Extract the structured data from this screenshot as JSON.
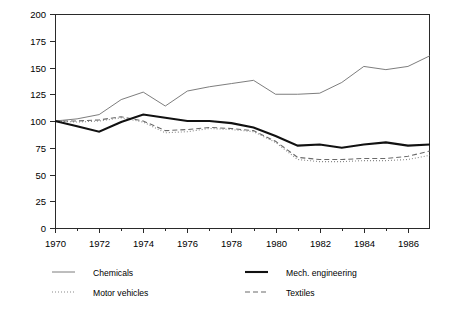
{
  "chart_data": {
    "type": "line",
    "title": "",
    "subtitle": "",
    "xlabel": "",
    "ylabel": "",
    "xlim": [
      1970,
      1987
    ],
    "ylim": [
      0,
      200
    ],
    "grid": false,
    "legend_position": "bottom",
    "x": [
      1970,
      1971,
      1972,
      1973,
      1974,
      1975,
      1976,
      1977,
      1978,
      1979,
      1980,
      1981,
      1982,
      1983,
      1984,
      1985,
      1986,
      1987
    ],
    "xticks": [
      "1970",
      "1972",
      "1974",
      "1976",
      "1978",
      "1980",
      "1982",
      "1984",
      "1986"
    ],
    "xtick_values": [
      1970,
      1972,
      1974,
      1976,
      1978,
      1980,
      1982,
      1984,
      1986
    ],
    "yticks": [
      "0",
      "25",
      "50",
      "75",
      "100",
      "125",
      "150",
      "175",
      "200"
    ],
    "ytick_values": [
      0,
      25,
      50,
      75,
      100,
      125,
      150,
      175,
      200
    ],
    "series": [
      {
        "name": "Chemicals",
        "style": "thin-solid",
        "color": "#6e6e6e",
        "values": [
          100,
          102,
          106,
          120,
          127,
          114,
          128,
          132,
          135,
          138,
          125,
          125,
          126,
          136,
          151,
          148,
          151,
          161
        ]
      },
      {
        "name": "Mech. engineering",
        "style": "thick-solid",
        "color": "#111111",
        "values": [
          100,
          95,
          90,
          99,
          106,
          103,
          100,
          100,
          98,
          94,
          86,
          77,
          78,
          75,
          78,
          80,
          77,
          78
        ]
      },
      {
        "name": "Motor vehicles",
        "style": "dotted",
        "color": "#8a8a8a",
        "values": [
          100,
          99,
          100,
          103,
          99,
          89,
          90,
          93,
          92,
          90,
          80,
          64,
          62,
          62,
          63,
          63,
          64,
          68
        ]
      },
      {
        "name": "Textiles",
        "style": "dashed",
        "color": "#6a6a6a",
        "values": [
          100,
          100,
          101,
          104,
          100,
          91,
          92,
          94,
          93,
          91,
          81,
          66,
          64,
          64,
          65,
          65,
          67,
          72
        ]
      }
    ]
  },
  "legend": {
    "items": [
      {
        "label": "Chemicals",
        "series": "Chemicals"
      },
      {
        "label": "Mech. engineering",
        "series": "Mech. engineering"
      },
      {
        "label": "Motor vehicles",
        "series": "Motor vehicles"
      },
      {
        "label": "Textiles",
        "series": "Textiles"
      }
    ]
  }
}
